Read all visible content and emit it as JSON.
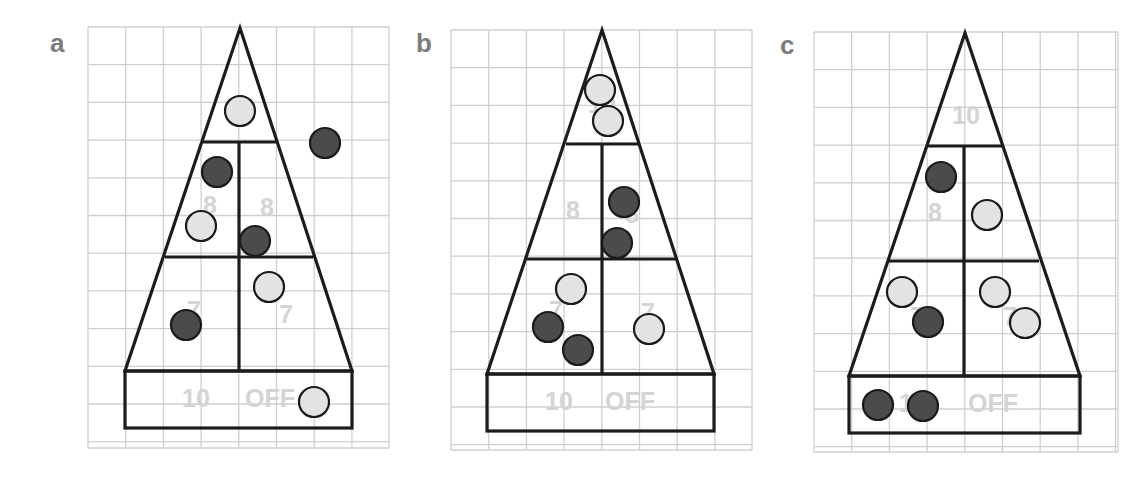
{
  "figure": {
    "width": 1147,
    "height": 477,
    "colors": {
      "grid": "#cfcfcf",
      "outline": "#1c1c1c",
      "zone_label": "#d4d4d4",
      "panel_label": "#7c7c7c",
      "puck_dark_fill": "#4b4b4b",
      "puck_light_fill": "#e3e3e3",
      "puck_stroke": "#1a1a1a"
    },
    "puck_radius": 15
  },
  "panels": [
    {
      "id": "a",
      "label": "a",
      "label_pos": [
        50,
        52
      ],
      "grid": {
        "x0": 88,
        "y0": 27,
        "x1": 389,
        "y1": 448,
        "cell": 37.7
      },
      "board": {
        "apex": [
          240,
          28
        ],
        "tier1_y": 142,
        "tier1_left": 203,
        "tier1_right": 277,
        "tier2_y": 257,
        "tier2_left": 165,
        "tier2_right": 313,
        "base_top": 371,
        "base_left": 125,
        "base_right": 352,
        "base_bottom": 428,
        "divider_x": 239
      },
      "zone_labels": [
        {
          "text": "8",
          "x": 210,
          "y": 207
        },
        {
          "text": "8",
          "x": 267,
          "y": 209
        },
        {
          "text": "7",
          "x": 194,
          "y": 312
        },
        {
          "text": "7",
          "x": 286,
          "y": 316
        },
        {
          "text": "10",
          "x": 196,
          "y": 400
        },
        {
          "text": "OFF",
          "x": 270,
          "y": 400
        }
      ],
      "pucks": [
        {
          "color": "light",
          "x": 240,
          "y": 111
        },
        {
          "color": "dark",
          "x": 325,
          "y": 143
        },
        {
          "color": "dark",
          "x": 217,
          "y": 172
        },
        {
          "color": "light",
          "x": 201,
          "y": 226
        },
        {
          "color": "dark",
          "x": 255,
          "y": 241
        },
        {
          "color": "light",
          "x": 269,
          "y": 287
        },
        {
          "color": "dark",
          "x": 186,
          "y": 325
        },
        {
          "color": "light",
          "x": 314,
          "y": 402
        }
      ]
    },
    {
      "id": "b",
      "label": "b",
      "label_pos": [
        416,
        52
      ],
      "grid": {
        "x0": 451,
        "y0": 30,
        "x1": 752,
        "y1": 450,
        "cell": 37.7
      },
      "board": {
        "apex": [
          602,
          30
        ],
        "tier1_y": 144,
        "tier1_left": 566,
        "tier1_right": 639,
        "tier2_y": 259,
        "tier2_left": 527,
        "tier2_right": 676,
        "base_top": 374,
        "base_left": 487,
        "base_right": 714,
        "base_bottom": 431,
        "divider_x": 602
      },
      "zone_labels": [
        {
          "text": "10",
          "x": 602,
          "y": 106
        },
        {
          "text": "8",
          "x": 573,
          "y": 212
        },
        {
          "text": "8",
          "x": 632,
          "y": 216
        },
        {
          "text": "7",
          "x": 556,
          "y": 312
        },
        {
          "text": "7",
          "x": 648,
          "y": 314
        },
        {
          "text": "10",
          "x": 559,
          "y": 403
        },
        {
          "text": "OFF",
          "x": 630,
          "y": 403
        }
      ],
      "pucks": [
        {
          "color": "light",
          "x": 600,
          "y": 90
        },
        {
          "color": "light",
          "x": 608,
          "y": 121
        },
        {
          "color": "dark",
          "x": 624,
          "y": 202
        },
        {
          "color": "dark",
          "x": 617,
          "y": 243
        },
        {
          "color": "light",
          "x": 571,
          "y": 289
        },
        {
          "color": "dark",
          "x": 548,
          "y": 327
        },
        {
          "color": "dark",
          "x": 578,
          "y": 350
        },
        {
          "color": "light",
          "x": 649,
          "y": 329
        }
      ]
    },
    {
      "id": "c",
      "label": "c",
      "label_pos": [
        780,
        54
      ],
      "grid": {
        "x0": 814,
        "y0": 32,
        "x1": 1118,
        "y1": 452,
        "cell": 37.7
      },
      "board": {
        "apex": [
          965,
          33
        ],
        "tier1_y": 146,
        "tier1_left": 928,
        "tier1_right": 1002,
        "tier2_y": 261,
        "tier2_left": 889,
        "tier2_right": 1039,
        "base_top": 376,
        "base_left": 849,
        "base_right": 1080,
        "base_bottom": 433,
        "divider_x": 964
      },
      "zone_labels": [
        {
          "text": "10",
          "x": 966,
          "y": 117
        },
        {
          "text": "8",
          "x": 935,
          "y": 214
        },
        {
          "text": "8",
          "x": 992,
          "y": 216
        },
        {
          "text": "7",
          "x": 917,
          "y": 318
        },
        {
          "text": "7",
          "x": 1010,
          "y": 318
        },
        {
          "text": "10",
          "x": 913,
          "y": 405
        },
        {
          "text": "OFF",
          "x": 993,
          "y": 405
        }
      ],
      "pucks": [
        {
          "color": "dark",
          "x": 941,
          "y": 177
        },
        {
          "color": "light",
          "x": 987,
          "y": 215
        },
        {
          "color": "light",
          "x": 902,
          "y": 292
        },
        {
          "color": "dark",
          "x": 928,
          "y": 322
        },
        {
          "color": "light",
          "x": 995,
          "y": 292
        },
        {
          "color": "light",
          "x": 1025,
          "y": 323
        },
        {
          "color": "dark",
          "x": 878,
          "y": 405
        },
        {
          "color": "dark",
          "x": 923,
          "y": 406
        }
      ]
    }
  ]
}
